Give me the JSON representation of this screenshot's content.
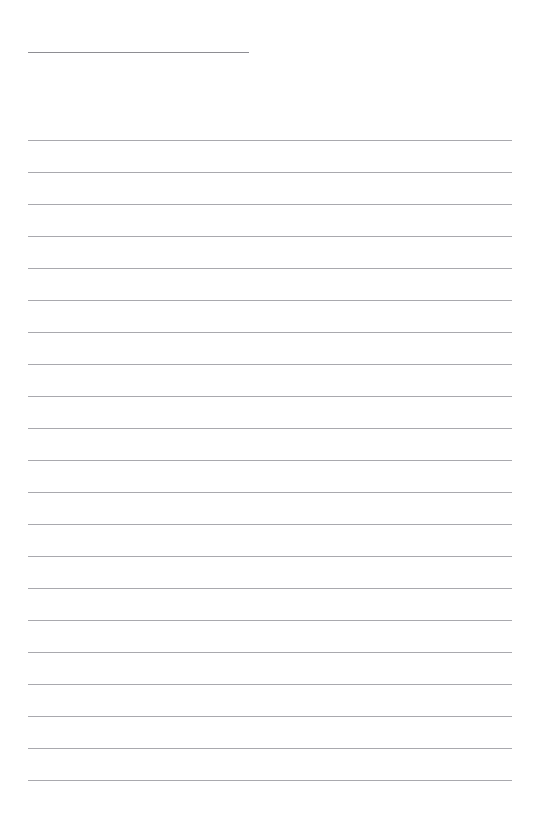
{
  "document": {
    "kind": "lined-paper-template",
    "title_text": "",
    "background_color": "#ffffff",
    "page_width": 539,
    "page_height": 828
  },
  "title_rule": {
    "name": "title-rule",
    "text": "",
    "placeholder": "",
    "x": 28,
    "y": 52,
    "width": 221,
    "color": "#8e8e93",
    "thickness": 1
  },
  "ruling": {
    "line_color": "#a9a9ae",
    "line_thickness": 1,
    "left_margin": 28,
    "right_edge": 512,
    "line_width": 484,
    "first_line_y": 140,
    "line_spacing": 32,
    "line_count": 21
  },
  "lines": [
    {
      "index": 1,
      "y": 140,
      "text": "",
      "placeholder": ""
    },
    {
      "index": 2,
      "y": 172,
      "text": "",
      "placeholder": ""
    },
    {
      "index": 3,
      "y": 204,
      "text": "",
      "placeholder": ""
    },
    {
      "index": 4,
      "y": 236,
      "text": "",
      "placeholder": ""
    },
    {
      "index": 5,
      "y": 268,
      "text": "",
      "placeholder": ""
    },
    {
      "index": 6,
      "y": 300,
      "text": "",
      "placeholder": ""
    },
    {
      "index": 7,
      "y": 332,
      "text": "",
      "placeholder": ""
    },
    {
      "index": 8,
      "y": 364,
      "text": "",
      "placeholder": ""
    },
    {
      "index": 9,
      "y": 396,
      "text": "",
      "placeholder": ""
    },
    {
      "index": 10,
      "y": 428,
      "text": "",
      "placeholder": ""
    },
    {
      "index": 11,
      "y": 460,
      "text": "",
      "placeholder": ""
    },
    {
      "index": 12,
      "y": 492,
      "text": "",
      "placeholder": ""
    },
    {
      "index": 13,
      "y": 524,
      "text": "",
      "placeholder": ""
    },
    {
      "index": 14,
      "y": 556,
      "text": "",
      "placeholder": ""
    },
    {
      "index": 15,
      "y": 588,
      "text": "",
      "placeholder": ""
    },
    {
      "index": 16,
      "y": 620,
      "text": "",
      "placeholder": ""
    },
    {
      "index": 17,
      "y": 652,
      "text": "",
      "placeholder": ""
    },
    {
      "index": 18,
      "y": 684,
      "text": "",
      "placeholder": ""
    },
    {
      "index": 19,
      "y": 716,
      "text": "",
      "placeholder": ""
    },
    {
      "index": 20,
      "y": 748,
      "text": "",
      "placeholder": ""
    },
    {
      "index": 21,
      "y": 780,
      "text": "",
      "placeholder": ""
    }
  ]
}
